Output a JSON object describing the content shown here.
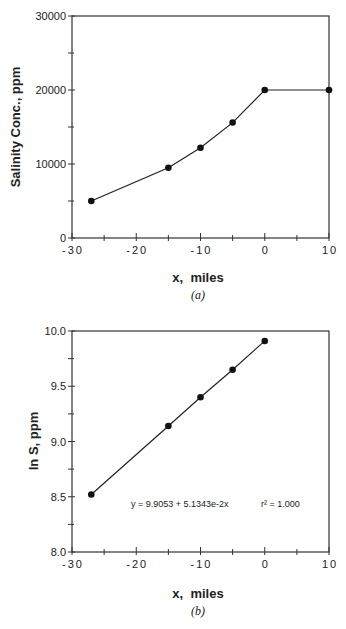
{
  "chart_data": [
    {
      "type": "line",
      "panel": "(a)",
      "title": "",
      "caption": "(a)",
      "xlabel": "x,  miles",
      "ylabel": "Salinity  Conc.,  ppm",
      "xlim": [
        -30,
        10
      ],
      "ylim": [
        0,
        30000
      ],
      "xticks": [
        -30,
        -20,
        -10,
        0,
        10
      ],
      "xtick_labels": [
        "-30",
        "-20",
        "-10",
        "0",
        "10"
      ],
      "yticks": [
        0,
        10000,
        20000,
        30000
      ],
      "ytick_labels": [
        "0",
        "10000",
        "20000",
        "30000"
      ],
      "x_minor_step": 5,
      "y_minor_step": 5000,
      "grid": false,
      "series": [
        {
          "name": "Salinity",
          "x": [
            -27,
            -15,
            -10,
            -5,
            0,
            10
          ],
          "y": [
            5000,
            9500,
            12200,
            15600,
            20000,
            20000
          ],
          "marker": "filled-circle"
        }
      ]
    },
    {
      "type": "line",
      "panel": "(b)",
      "title": "",
      "caption": "(b)",
      "xlabel": "x,  miles",
      "ylabel": "ln S, ppm",
      "xlim": [
        -30,
        10
      ],
      "ylim": [
        8.0,
        10.0
      ],
      "xticks": [
        -30,
        -20,
        -10,
        0,
        10
      ],
      "xtick_labels": [
        "-30",
        "-20",
        "-10",
        "0",
        "10"
      ],
      "yticks": [
        8.0,
        8.5,
        9.0,
        9.5,
        10.0
      ],
      "ytick_labels": [
        "8.0",
        "8.5",
        "9.0",
        "9.5",
        "10.0"
      ],
      "x_minor_step": 5,
      "y_minor_step": 0.25,
      "grid": false,
      "annotations": [
        {
          "text": "y = 9.9053 + 5.1343e-2x",
          "x": -17,
          "y": 8.5
        },
        {
          "text": "r² = 1.000",
          "x": -3,
          "y": 8.5
        }
      ],
      "series": [
        {
          "name": "ln S",
          "x": [
            -27,
            -15,
            -10,
            -5,
            0
          ],
          "y": [
            8.52,
            9.14,
            9.4,
            9.65,
            9.91
          ],
          "marker": "filled-circle",
          "fit": {
            "intercept": 9.9053,
            "slope": 0.051343,
            "r2": 1.0
          }
        }
      ]
    }
  ]
}
